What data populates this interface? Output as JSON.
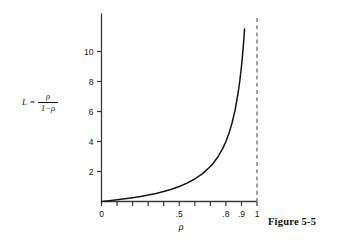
{
  "figure": {
    "caption": "Figure 5-5"
  },
  "equation_label": {
    "lhs": "L",
    "equals": "=",
    "numerator": "ρ",
    "denominator": "1−ρ",
    "plain": "L = ρ/(1−ρ)"
  },
  "chart_data": {
    "type": "line",
    "title": "",
    "subtitle": "",
    "xlabel": "ρ",
    "ylabel": "L = ρ/(1−ρ)",
    "xlim": [
      0,
      1
    ],
    "ylim": [
      0,
      11.6
    ],
    "grid": false,
    "legend": "none",
    "curve_color": "#151515",
    "asymptote_color": "#8a8a8a",
    "axis_color": "#3a3a3a",
    "x_ticks": [
      0,
      0.1,
      0.2,
      0.3,
      0.4,
      0.5,
      0.6,
      0.7,
      0.8,
      0.9,
      1
    ],
    "x_tick_labels": [
      "0",
      "",
      "",
      "",
      "",
      ".5",
      "",
      "",
      ".8",
      ".9",
      "1"
    ],
    "y_ticks": [
      2,
      4,
      6,
      8,
      10
    ],
    "y_tick_labels": [
      "2",
      "4",
      "6",
      "8",
      "10"
    ],
    "asymptote": {
      "orientation": "vertical",
      "x": 1,
      "style": "dashed"
    },
    "series": [
      {
        "name": "L = ρ/(1−ρ)",
        "style": "solid",
        "x": [
          0.0,
          0.05,
          0.1,
          0.15,
          0.2,
          0.25,
          0.3,
          0.35,
          0.4,
          0.45,
          0.5,
          0.55,
          0.6,
          0.65,
          0.7,
          0.72,
          0.75,
          0.78,
          0.8,
          0.82,
          0.84,
          0.86,
          0.88,
          0.89,
          0.9,
          0.905,
          0.91,
          0.915,
          0.92
        ],
        "y": [
          0.0,
          0.053,
          0.111,
          0.176,
          0.25,
          0.333,
          0.429,
          0.538,
          0.667,
          0.818,
          1.0,
          1.222,
          1.5,
          1.857,
          2.333,
          2.571,
          3.0,
          3.545,
          4.0,
          4.556,
          5.25,
          6.143,
          7.333,
          8.091,
          9.0,
          9.526,
          10.111,
          10.765,
          11.5
        ]
      }
    ]
  }
}
